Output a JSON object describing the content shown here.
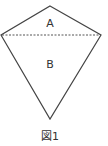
{
  "figure": {
    "caption": "図1",
    "regions": [
      {
        "id": "A",
        "label": "A"
      },
      {
        "id": "B",
        "label": "B"
      }
    ],
    "shape": "kite",
    "vertices": {
      "top": [
        50,
        6
      ],
      "left": [
        1,
        35
      ],
      "right": [
        101,
        35
      ],
      "bottom": [
        50,
        119
      ]
    },
    "diagonal_style": "dashed",
    "stroke_color": "#444444"
  }
}
